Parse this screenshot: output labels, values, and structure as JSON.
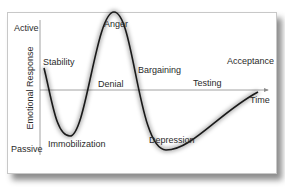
{
  "diagram": {
    "type": "change-curve",
    "y_axis": {
      "title": "Emotional Response",
      "top_label": "Active",
      "bottom_label": "Passive"
    },
    "x_axis": {
      "label": "Time"
    },
    "stages": [
      {
        "label": "Stability"
      },
      {
        "label": "Immobilization"
      },
      {
        "label": "Denial"
      },
      {
        "label": "Anger"
      },
      {
        "label": "Bargaining"
      },
      {
        "label": "Depression"
      },
      {
        "label": "Testing"
      },
      {
        "label": "Acceptance"
      }
    ],
    "colors": {
      "curve": "#1a1a1a",
      "axis": "#8a8a8a",
      "text": "#2a2a2a",
      "background": "#ffffff"
    }
  }
}
